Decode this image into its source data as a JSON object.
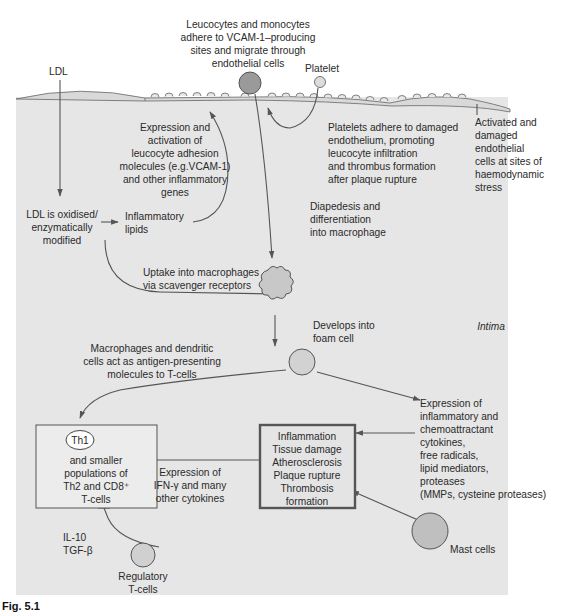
{
  "figure": {
    "caption_label": "Fig. 5.1",
    "region_label": "Intima",
    "colors": {
      "intima_fill": "#e6e6e6",
      "endothelium_fill": "#d9d9d9",
      "cell_fill": "#c8c8c8",
      "leucocyte_fill": "#9a9a9a",
      "arrow": "#555555",
      "outline": "#555555",
      "box_border": "#555555",
      "outcome_box_border": "#555555"
    }
  },
  "nodes": {
    "ldl": {
      "label": "LDL"
    },
    "leucocytes": {
      "lines": [
        "Leucocytes and monocytes",
        "adhere to VCAM-1–producing",
        "sites and migrate through",
        "endothelial cells"
      ]
    },
    "platelet": {
      "label": "Platelet"
    },
    "expression_adhesion": {
      "lines": [
        "Expression and",
        "activation of",
        "leucocyte adhesion",
        "molecules (e.g.VCAM-1)",
        "and other inflammatory",
        "genes"
      ]
    },
    "platelets_adhere": {
      "lines": [
        "Platelets adhere to damaged",
        "endothelium, promoting",
        "leucocyte infiltration",
        "and thrombus formation",
        "after plaque rupture"
      ]
    },
    "activated_endothelial": {
      "lines": [
        "Activated and",
        "damaged",
        "endothelial",
        "cells at sites of",
        "haemodynamic",
        "stress"
      ]
    },
    "ldl_oxidised": {
      "lines": [
        "LDL is oxidised/",
        "enzymatically",
        "modified"
      ]
    },
    "inflammatory_lipids": {
      "lines": [
        "Inflammatory",
        "lipids"
      ]
    },
    "diapedesis": {
      "lines": [
        "Diapedesis and",
        "differentiation",
        "into macrophage"
      ]
    },
    "uptake": {
      "lines": [
        "Uptake into macrophages",
        "via scavenger receptors"
      ]
    },
    "foam_cell": {
      "lines": [
        "Develops into",
        "foam cell"
      ]
    },
    "antigen_presenting": {
      "lines": [
        "Macrophages and dendritic",
        "cells act as antigen-presenting",
        "molecules to T-cells"
      ]
    },
    "th1_box": {
      "badge": "Th1",
      "lines": [
        "and smaller",
        "populations of",
        "Th2 and CD8⁺",
        "T-cells"
      ]
    },
    "ifn": {
      "lines": [
        "Expression of",
        "IFN-γ and many",
        "other cytokines"
      ]
    },
    "outcome_box": {
      "lines": [
        "Inflammation",
        "Tissue damage",
        "Atherosclerosis",
        "Plaque rupture",
        "Thrombosis",
        "formation"
      ]
    },
    "cytokines": {
      "lines": [
        "Expression of",
        "inflammatory and",
        "chemoattractant",
        "cytokines,",
        "free radicals,",
        "lipid mediators,",
        "proteases",
        "(MMPs, cysteine proteases)"
      ]
    },
    "il10": {
      "lines": [
        "IL-10",
        "TGF-β"
      ]
    },
    "regulatory": {
      "lines": [
        "Regulatory",
        "T-cells"
      ]
    },
    "mast": {
      "label": "Mast cells"
    }
  }
}
